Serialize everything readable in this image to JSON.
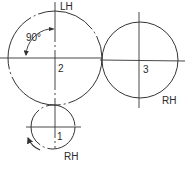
{
  "diagram": {
    "type": "gear-train",
    "colors": {
      "line": "#333333",
      "background": "#ffffff"
    },
    "gears": [
      {
        "id": "1",
        "label": "1",
        "hand": "RH",
        "cx": 53,
        "cy": 127,
        "r": 22,
        "rotation_arrow": "counterclockwise"
      },
      {
        "id": "2",
        "label": "2",
        "hand": "LH",
        "cx": 55,
        "cy": 58,
        "r": 47
      },
      {
        "id": "3",
        "label": "3",
        "hand": "RH",
        "cx": 140,
        "cy": 60,
        "r": 38
      }
    ],
    "angle_annotation": {
      "text": "90°"
    },
    "labels": {
      "gear1_number": "1",
      "gear2_number": "2",
      "gear3_number": "3",
      "gear1_hand": "RH",
      "gear2_hand": "LH",
      "gear3_hand": "RH",
      "angle": "90°"
    }
  }
}
